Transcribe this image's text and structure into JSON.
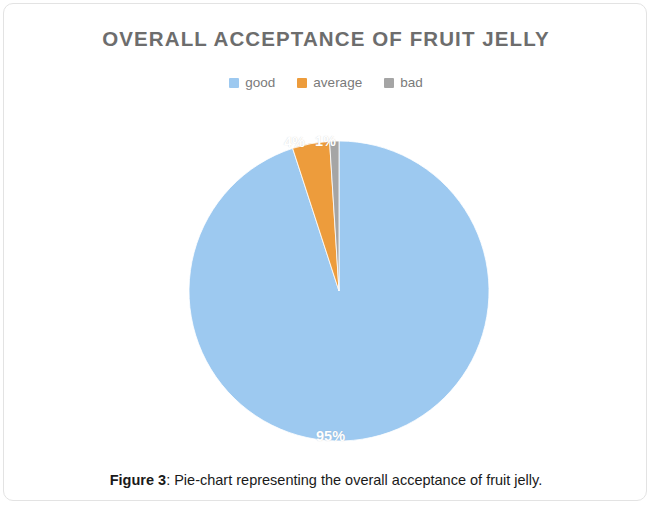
{
  "figure": {
    "caption_label": "Figure 3",
    "caption_separator": ": ",
    "caption_text": "Pie-chart representing the overall acceptance of fruit jelly."
  },
  "chart": {
    "title": "OVERALL ACCEPTANCE OF FRUIT JELLY",
    "legend": [
      {
        "label": "good",
        "color": "#9dc9f0"
      },
      {
        "label": "average",
        "color": "#ed9c3c"
      },
      {
        "label": "bad",
        "color": "#a5a5a5"
      }
    ],
    "labels": {
      "good": "95%",
      "average": "4%",
      "bad": "1%"
    }
  },
  "chart_data": {
    "type": "pie",
    "title": "OVERALL ACCEPTANCE OF FRUIT JELLY",
    "categories": [
      "good",
      "average",
      "bad"
    ],
    "values": [
      95,
      4,
      1
    ],
    "value_labels": [
      "95%",
      "4%",
      "1%"
    ],
    "colors": [
      "#9dc9f0",
      "#ed9c3c",
      "#a5a5a5"
    ],
    "units": "percent",
    "total": 100,
    "start_angle_deg": 0,
    "direction": "clockwise",
    "legend_position": "top",
    "grid": false,
    "xlabel": "",
    "ylabel": ""
  }
}
